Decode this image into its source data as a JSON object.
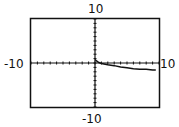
{
  "labels": {
    "ymax": "10",
    "ymin": "-10",
    "xmin": "-10",
    "xmax": "10"
  },
  "chart_data": {
    "type": "line",
    "title": "",
    "xlabel": "",
    "ylabel": "",
    "xlim": [
      -10,
      10
    ],
    "ylim": [
      -10,
      10
    ],
    "xscale_ticks": 1,
    "yscale_ticks": 1,
    "grid": false,
    "series": [
      {
        "name": "graph",
        "x": [
          0,
          0.3,
          0.6,
          1,
          2,
          3,
          4,
          5,
          6,
          7,
          8,
          9,
          9.5
        ],
        "y": [
          0.8,
          0.4,
          0.1,
          -0.1,
          -0.4,
          -0.6,
          -0.9,
          -1.1,
          -1.3,
          -1.4,
          -1.4,
          -1.6,
          -1.6
        ]
      }
    ]
  }
}
